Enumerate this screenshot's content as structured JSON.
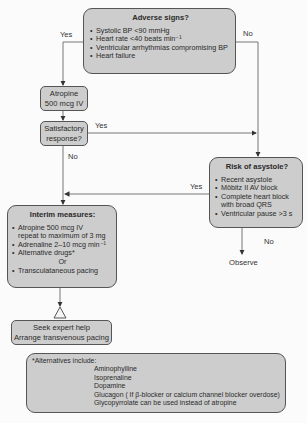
{
  "adverse": {
    "title": "Adverse signs?",
    "items": [
      "Systolic BP <90 mmHg",
      "Heart rate <40 beats min⁻¹",
      "Ventricular arrhythmias compromising BP",
      "Heart failure"
    ],
    "yes_label": "Yes",
    "no_label": "No"
  },
  "atropine": {
    "line1": "Atropine",
    "line2": "500 mcg IV"
  },
  "satisfactory": {
    "line1": "Satisfactory",
    "line2": "response?",
    "yes_label": "Yes",
    "no_label": "No"
  },
  "risk": {
    "title": "Risk of asystole?",
    "items": [
      "Recent asystole",
      "Möbitz II AV block",
      "Complete heart block",
      "with broad QRS",
      "Ventricular pause >3 s"
    ],
    "yes_label": "Yes",
    "no_label": "No",
    "observe": "Observe"
  },
  "interim": {
    "title": "Interim measures:",
    "items": [
      "Atropine 500 mcg IV",
      "repeat to maximum of 3 mg",
      "Adrenaline 2–10 mcg min⁻¹",
      "Alternative drugs*"
    ],
    "or": "Or",
    "last": "Transculataneous pacing"
  },
  "expert": {
    "line1": "Seek expert help",
    "line2": "Arrange transvenous pacing"
  },
  "alternatives": {
    "heading": "*Alternatives include:",
    "items": [
      "Aminophylline",
      "Isoprenaline",
      "Dopamine",
      "Glucagon ( If β-blocker or calcium channel blocker overdose)",
      "Glycopyrrolate can be used instead of atropine"
    ]
  },
  "colors": {
    "box_fill": "#cdcdcd",
    "border": "#555555",
    "line": "#666666",
    "background": "#fbfbfb"
  }
}
